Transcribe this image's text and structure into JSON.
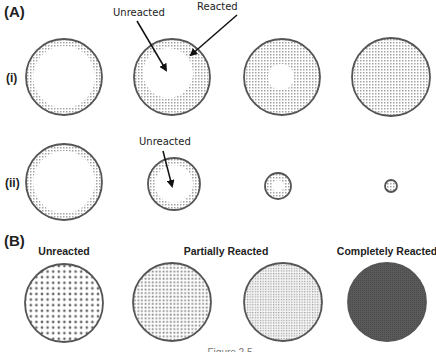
{
  "panels": {
    "A": {
      "label": "(A)",
      "rows": [
        {
          "label": "(i)",
          "description": "Shrinking unreacted core - constant particle size",
          "circles": [
            {
              "cx": 64,
              "cy": 77,
              "r": 38,
              "core_r": 31,
              "core_dx": 0,
              "core_dy": 0
            },
            {
              "cx": 172,
              "cy": 77,
              "r": 38,
              "core_r": 25,
              "core_dx": -4,
              "core_dy": -4
            },
            {
              "cx": 282,
              "cy": 77,
              "r": 38,
              "core_r": 13,
              "core_dx": -1,
              "core_dy": 0
            },
            {
              "cx": 391,
              "cy": 77,
              "r": 39,
              "core_r": 0,
              "core_dx": 0,
              "core_dy": 0
            }
          ],
          "annotations": [
            {
              "text": "Unreacted",
              "x": 113,
              "y": 16,
              "arrow": [
                137,
                21,
                166,
                70
              ]
            },
            {
              "text": "Reacted",
              "x": 197,
              "y": 10,
              "arrow": [
                237,
                15,
                191,
                55
              ]
            }
          ]
        },
        {
          "label": "(ii)",
          "description": "Shrinking particle",
          "circles": [
            {
              "cx": 64,
              "cy": 182,
              "r": 38,
              "core_r": 31,
              "core_dx": 0,
              "core_dy": 0
            },
            {
              "cx": 174,
              "cy": 184,
              "r": 26,
              "core_r": 19,
              "core_dx": 0,
              "core_dy": 0
            },
            {
              "cx": 278,
              "cy": 186,
              "r": 13,
              "core_r": 6,
              "core_dx": 0,
              "core_dy": 0
            },
            {
              "cx": 391,
              "cy": 186,
              "r": 6,
              "core_r": 0,
              "core_dx": 0,
              "core_dy": 0
            }
          ],
          "annotations": [
            {
              "text": "Unreacted",
              "x": 139,
              "y": 145,
              "arrow": [
                163,
                151,
                172,
                186
              ]
            }
          ]
        }
      ]
    },
    "B": {
      "label": "(B)",
      "headings": [
        {
          "text": "Unreacted",
          "x": 64
        },
        {
          "text": "Partially Reacted",
          "x": 226
        },
        {
          "text": "Completely Reacted",
          "x": 387
        }
      ],
      "circles": [
        {
          "cx": 64,
          "cy": 303,
          "r": 39,
          "pattern": "coarse"
        },
        {
          "cx": 172,
          "cy": 302,
          "r": 39,
          "pattern": "medium"
        },
        {
          "cx": 283,
          "cy": 302,
          "r": 39,
          "pattern": "fine"
        },
        {
          "cx": 387,
          "cy": 302,
          "r": 39,
          "pattern": "dark"
        }
      ]
    }
  },
  "caption": "Figure 2.5",
  "colors": {
    "outline": "#555555",
    "reacted_dot": "#9a9a9a",
    "dark_fill": "#5a5a5a",
    "text": "#222222"
  }
}
